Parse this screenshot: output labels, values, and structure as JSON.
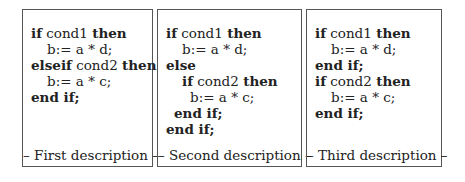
{
  "panels": [
    {
      "description": "– First description –",
      "lines": [
        {
          "indent": 0,
          "parts": [
            {
              "t": "if",
              "kw": true
            },
            {
              "t": " cond1 ",
              "kw": false
            },
            {
              "t": "then",
              "kw": true
            }
          ]
        },
        {
          "indent": 1,
          "parts": [
            {
              "t": "b:= a * d;",
              "kw": false
            }
          ]
        },
        {
          "indent": 0,
          "parts": [
            {
              "t": "elseif",
              "kw": true
            },
            {
              "t": " cond2 ",
              "kw": false
            },
            {
              "t": "then",
              "kw": true
            }
          ]
        },
        {
          "indent": 1,
          "parts": [
            {
              "t": "b:= a * c;",
              "kw": false
            }
          ]
        },
        {
          "indent": 0,
          "parts": [
            {
              "t": "end if;",
              "kw": true
            }
          ]
        }
      ]
    },
    {
      "description": "– Second description –",
      "lines": [
        {
          "indent": 0,
          "parts": [
            {
              "t": "if",
              "kw": true
            },
            {
              "t": " cond1 ",
              "kw": false
            },
            {
              "t": "then",
              "kw": true
            }
          ]
        },
        {
          "indent": 1,
          "parts": [
            {
              "t": "b:= a * d;",
              "kw": false
            }
          ]
        },
        {
          "indent": 0,
          "parts": [
            {
              "t": "else",
              "kw": true
            }
          ]
        },
        {
          "indent": 1,
          "parts": [
            {
              "t": "if",
              "kw": true
            },
            {
              "t": " cond2 ",
              "kw": false
            },
            {
              "t": "then",
              "kw": true
            }
          ]
        },
        {
          "indent": 2,
          "parts": [
            {
              "t": "b:= a * c;",
              "kw": false
            }
          ]
        },
        {
          "indent": 3,
          "parts": [
            {
              "t": "end if;",
              "kw": true
            }
          ]
        },
        {
          "indent": 0,
          "parts": [
            {
              "t": "end if;",
              "kw": true
            }
          ]
        }
      ]
    },
    {
      "description": "– Third description –",
      "lines": [
        {
          "indent": 0,
          "parts": [
            {
              "t": "if",
              "kw": true
            },
            {
              "t": " cond1 ",
              "kw": false
            },
            {
              "t": "then",
              "kw": true
            }
          ]
        },
        {
          "indent": 1,
          "parts": [
            {
              "t": "b:= a * d;",
              "kw": false
            }
          ]
        },
        {
          "indent": 0,
          "parts": [
            {
              "t": "end if;",
              "kw": true
            }
          ]
        },
        {
          "indent": 0,
          "parts": [
            {
              "t": "if",
              "kw": true
            },
            {
              "t": " cond2 ",
              "kw": false
            },
            {
              "t": "then",
              "kw": true
            }
          ]
        },
        {
          "indent": 1,
          "parts": [
            {
              "t": "b:= a * c;",
              "kw": false
            }
          ]
        },
        {
          "indent": 0,
          "parts": [
            {
              "t": "end if;",
              "kw": true
            }
          ]
        }
      ]
    }
  ]
}
